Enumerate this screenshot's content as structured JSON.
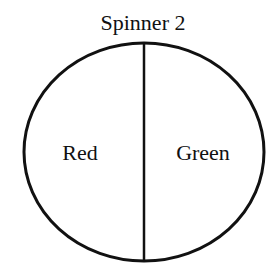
{
  "title": "Spinner 2",
  "spinner": {
    "sections": [
      {
        "label": "Red",
        "fraction": 0.5
      },
      {
        "label": "Green",
        "fraction": 0.5
      }
    ]
  }
}
